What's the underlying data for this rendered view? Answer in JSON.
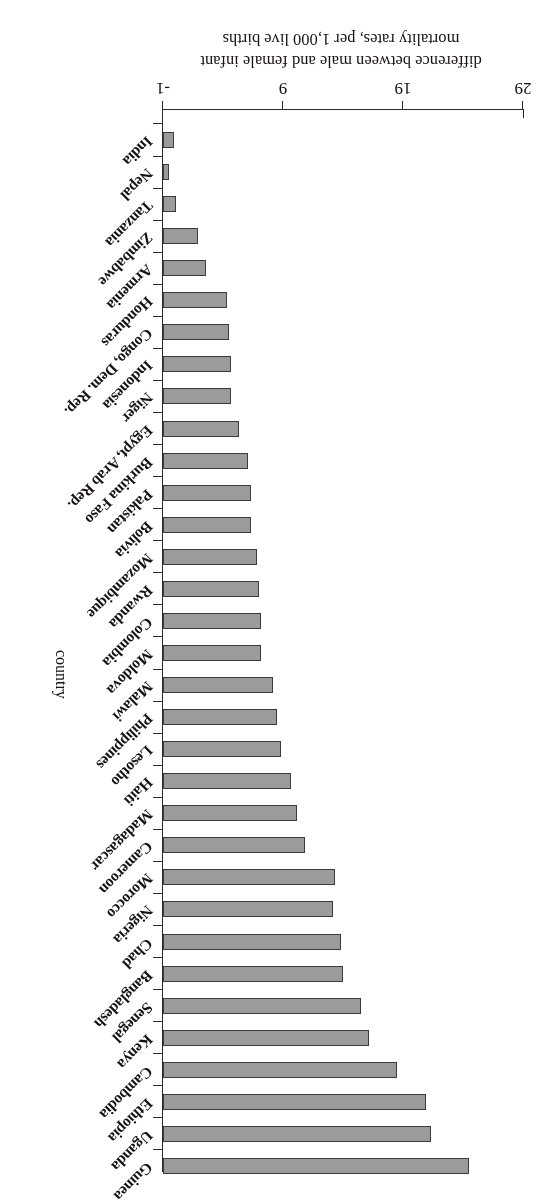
{
  "chart_data": {
    "type": "bar",
    "orientation": "horizontal",
    "title": "",
    "xlabel": "difference between male and female infant mortality rates, per 1,000 live births",
    "ylabel": "country",
    "xlim": [
      -1,
      29
    ],
    "xticks": [
      -1,
      9,
      19,
      29
    ],
    "xticklabels": [
      "-1",
      "9",
      "19",
      "29"
    ],
    "grid": false,
    "legend": null,
    "bar_color": "#9b9b9b",
    "bar_edge_color": "#3b3b3b",
    "categories": [
      "Guinea",
      "Uganda",
      "Ethiopia",
      "Cambodia",
      "Kenya",
      "Senegal",
      "Bangladesh",
      "Chad",
      "Nigeria",
      "Morocco",
      "Cameroon",
      "Madagascar",
      "Haiti",
      "Lesotho",
      "Philippines",
      "Malawi",
      "Moldova",
      "Colombia",
      "Rwanda",
      "Mozambique",
      "Bolivia",
      "Pakistan",
      "Burkina Faso",
      "Egypt, Arab Rep.",
      "Niger",
      "Indonesia",
      "Congo, Dem. Rep.",
      "Honduras",
      "Armenia",
      "Zimbabwe",
      "Tanzania",
      "Nepal",
      "India"
    ],
    "values": [
      24.5,
      21.3,
      20.9,
      18.5,
      16.2,
      15.5,
      14.0,
      13.8,
      13.2,
      13.3,
      10.8,
      10.2,
      9.7,
      8.8,
      8.5,
      8.2,
      7.2,
      7.2,
      7.0,
      6.8,
      6.3,
      6.3,
      6.1,
      5.3,
      4.7,
      4.7,
      4.5,
      4.3,
      2.6,
      1.9,
      0.1,
      -0.5,
      -0.1
    ]
  },
  "axes": {
    "value_axis_label": "difference between male and female infant mortality rates, per 1,000 live births",
    "category_axis_label": "country"
  }
}
